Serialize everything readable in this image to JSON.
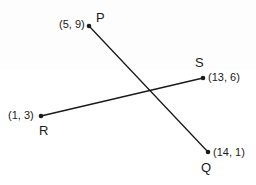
{
  "figure": {
    "type": "coordinate-geometry-diagram",
    "background_color": "#ffffff",
    "stroke_color": "#1a1a1a",
    "width": 256,
    "height": 185
  },
  "points": {
    "P": {
      "name": "P",
      "coord_label": "(5, 9)",
      "x": 89,
      "y": 26
    },
    "Q": {
      "name": "Q",
      "coord_label": "(14, 1)",
      "x": 208,
      "y": 152
    },
    "R": {
      "name": "R",
      "coord_label": "(1, 3)",
      "x": 41,
      "y": 116
    },
    "S": {
      "name": "S",
      "coord_label": "(13, 6)",
      "x": 203,
      "y": 78
    }
  },
  "segments": [
    {
      "id": "PQ",
      "from": "P",
      "to": "Q",
      "x1": 89,
      "y1": 26,
      "x2": 208,
      "y2": 152
    },
    {
      "id": "RS",
      "from": "R",
      "to": "S",
      "x1": 41,
      "y1": 116,
      "x2": 203,
      "y2": 78
    }
  ]
}
